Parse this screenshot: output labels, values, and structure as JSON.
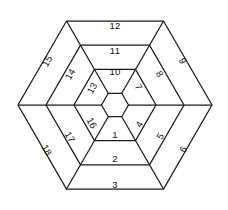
{
  "figure": {
    "background_color": "#ffffff",
    "stroke_color": "#1a1a1a",
    "label_color": "#111111"
  },
  "chart_data": {
    "type": "diagram",
    "subtype": "concentric-hexagon-ring-partition",
    "title": "",
    "xlabel": "",
    "ylabel": "",
    "center": [
      115,
      105
    ],
    "hexagon_orientation": "flat-top",
    "hexagon_radii": [
      13.5,
      41,
      69,
      97
    ],
    "ring_count": 3,
    "cells_per_ring": 6,
    "total_cells": 18,
    "inner_hexagon_empty": true,
    "sector_order": [
      "bottom",
      "lower-right",
      "upper-right",
      "top",
      "upper-left",
      "lower-left"
    ],
    "cells": [
      {
        "label": "1",
        "ring": 1,
        "sector": "bottom",
        "x": 115,
        "y": 134,
        "rotation": 0
      },
      {
        "label": "2",
        "ring": 2,
        "sector": "bottom",
        "x": 115,
        "y": 158,
        "rotation": 0
      },
      {
        "label": "3",
        "ring": 3,
        "sector": "bottom",
        "x": 115,
        "y": 184,
        "rotation": 0
      },
      {
        "label": "4",
        "ring": 1,
        "sector": "lower-right",
        "x": 139,
        "y": 124,
        "rotation": -60
      },
      {
        "label": "5",
        "ring": 2,
        "sector": "lower-right",
        "x": 160,
        "y": 136,
        "rotation": -60
      },
      {
        "label": "6",
        "ring": 3,
        "sector": "lower-right",
        "x": 183,
        "y": 149,
        "rotation": -60
      },
      {
        "label": "7",
        "ring": 1,
        "sector": "upper-right",
        "x": 139,
        "y": 87,
        "rotation": 60
      },
      {
        "label": "8",
        "ring": 2,
        "sector": "upper-right",
        "x": 160,
        "y": 74,
        "rotation": 60
      },
      {
        "label": "9",
        "ring": 3,
        "sector": "upper-right",
        "x": 183,
        "y": 61,
        "rotation": 60
      },
      {
        "label": "10",
        "ring": 1,
        "sector": "top",
        "x": 115,
        "y": 71,
        "rotation": 0
      },
      {
        "label": "11",
        "ring": 2,
        "sector": "top",
        "x": 115,
        "y": 50,
        "rotation": 0
      },
      {
        "label": "12",
        "ring": 3,
        "sector": "top",
        "x": 115,
        "y": 25,
        "rotation": 0
      },
      {
        "label": "13",
        "ring": 1,
        "sector": "upper-left",
        "x": 92,
        "y": 88,
        "rotation": -60
      },
      {
        "label": "14",
        "ring": 2,
        "sector": "upper-left",
        "x": 70,
        "y": 74,
        "rotation": -60
      },
      {
        "label": "15",
        "ring": 3,
        "sector": "upper-left",
        "x": 47,
        "y": 61,
        "rotation": -60
      },
      {
        "label": "16",
        "ring": 1,
        "sector": "lower-left",
        "x": 92,
        "y": 123,
        "rotation": 60
      },
      {
        "label": "17",
        "ring": 2,
        "sector": "lower-left",
        "x": 70,
        "y": 137,
        "rotation": 60
      },
      {
        "label": "18",
        "ring": 3,
        "sector": "lower-left",
        "x": 47,
        "y": 150,
        "rotation": 60
      }
    ],
    "hexagons": [
      {
        "name": "inner",
        "radius": 13.5,
        "label": ""
      },
      {
        "name": "ring-1-outer",
        "radius": 41,
        "label": ""
      },
      {
        "name": "ring-2-outer",
        "radius": 69,
        "label": ""
      },
      {
        "name": "ring-3-outer",
        "radius": 97,
        "label": ""
      }
    ],
    "spokes": [
      {
        "angle_deg": 0
      },
      {
        "angle_deg": 60
      },
      {
        "angle_deg": 120
      },
      {
        "angle_deg": 180
      },
      {
        "angle_deg": 240
      },
      {
        "angle_deg": 300
      }
    ]
  }
}
